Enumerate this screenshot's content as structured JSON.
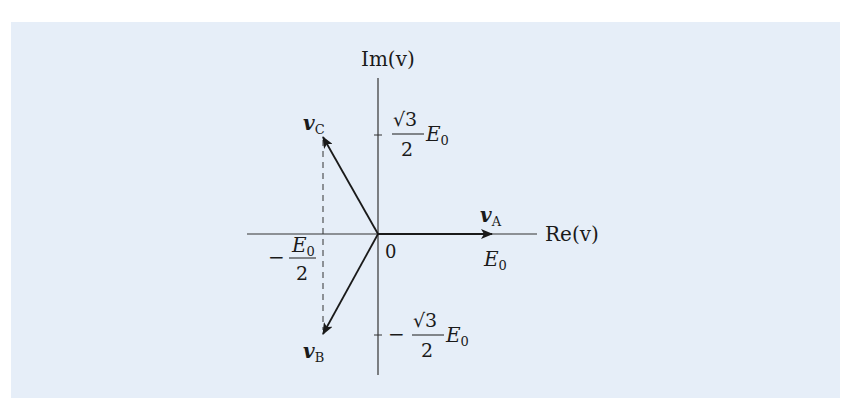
{
  "diagram": {
    "background_color": "#e6eef8",
    "axes": {
      "horizontal_label": "Re(v)",
      "vertical_label": "Im(v)",
      "origin_label": "0"
    },
    "ticks": {
      "re_negative_half": {
        "sign": "−",
        "numerator": "E",
        "numerator_sub": "0",
        "denominator": "2"
      },
      "re_one": {
        "text": "E",
        "sub": "0"
      },
      "im_positive": {
        "numerator": "√3",
        "denominator": "2",
        "factor": "E",
        "factor_sub": "0"
      },
      "im_negative": {
        "sign": "−",
        "numerator": "√3",
        "denominator": "2",
        "factor": "E",
        "factor_sub": "0"
      }
    },
    "vectors": [
      {
        "id": "A",
        "label": "v",
        "sub": "A",
        "angle_deg": 0,
        "magnitude": "E0"
      },
      {
        "id": "B",
        "label": "v",
        "sub": "B",
        "angle_deg": -120,
        "magnitude": "E0"
      },
      {
        "id": "C",
        "label": "v",
        "sub": "C",
        "angle_deg": 120,
        "magnitude": "E0"
      }
    ],
    "projection_line": "dashed line from v_C to v_B at Re = −E0/2"
  }
}
